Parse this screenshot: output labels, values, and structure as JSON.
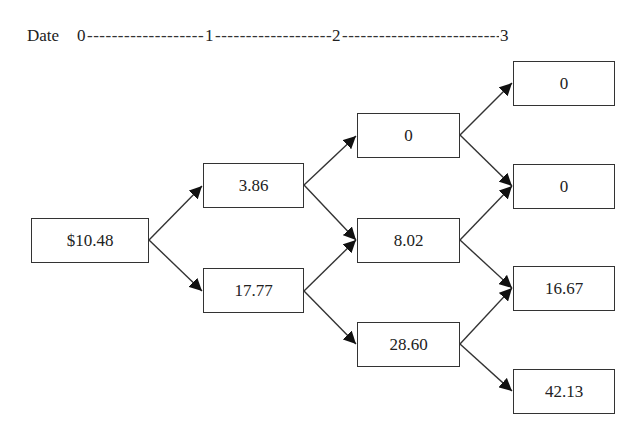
{
  "timeline": {
    "label": "Date",
    "ticks": [
      "0",
      "1",
      "2",
      "3"
    ],
    "dashes": "--------------------------------------------------------------------------------"
  },
  "tree": {
    "date0": {
      "root": "$10.48"
    },
    "date1": {
      "up": "3.86",
      "down": "17.77"
    },
    "date2": {
      "uu": "0",
      "ud": "8.02",
      "dd": "28.60"
    },
    "date3": {
      "uuu": "0",
      "uud": "0",
      "udd": "16.67",
      "ddd": "42.13"
    }
  },
  "colors": {
    "line": "#333333",
    "text": "#222222",
    "background": "#ffffff"
  }
}
